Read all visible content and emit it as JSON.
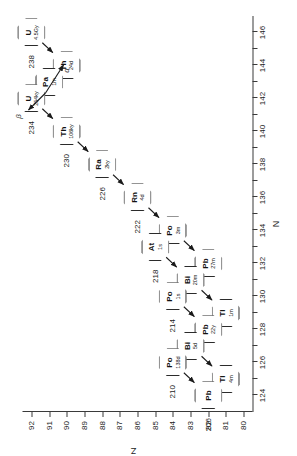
{
  "figure": {
    "type": "decay-chain-scatter",
    "orientation": "rotated-90",
    "x_axis": {
      "label": "N",
      "min": 123,
      "max": 147,
      "ticks": [
        124,
        125,
        126,
        127,
        128,
        129,
        130,
        131,
        132,
        133,
        134,
        135,
        136,
        137,
        138,
        139,
        140,
        141,
        142,
        143,
        144,
        145,
        146
      ],
      "labeled_ticks": [
        124,
        126,
        128,
        130,
        132,
        134,
        136,
        138,
        140,
        142,
        144,
        146
      ]
    },
    "y_axis": {
      "label": "Z",
      "min": 79.5,
      "max": 92.5,
      "ticks": [
        80,
        81,
        82,
        83,
        84,
        85,
        86,
        87,
        88,
        89,
        90,
        91,
        92
      ],
      "labeled_ticks": [
        80,
        81,
        82,
        83,
        84,
        85,
        86,
        87,
        88,
        89,
        90,
        91,
        92
      ]
    },
    "legend": {
      "beta_label": "β",
      "alpha_label": "α"
    }
  },
  "chart_data": {
    "type": "scatter",
    "title": "",
    "xlabel": "N",
    "ylabel": "Z",
    "xlim": [
      123,
      147
    ],
    "ylim": [
      79.5,
      92.5
    ],
    "grid": false,
    "legend_position": "top-right",
    "nodes": [
      {
        "id": "U238",
        "element": "U",
        "mass": 238,
        "Z": 92,
        "N": 146,
        "halflife": "4.5Gy",
        "mass_label": "238"
      },
      {
        "id": "Th234",
        "element": "Th",
        "mass": 234,
        "Z": 90,
        "N": 144,
        "halflife": "24d",
        "mass_label": ""
      },
      {
        "id": "Pa234",
        "element": "Pa",
        "mass": 234,
        "Z": 91,
        "N": 143,
        "halflife": "1m",
        "mass_label": ""
      },
      {
        "id": "U234",
        "element": "U",
        "mass": 234,
        "Z": 92,
        "N": 142,
        "halflife": "254ky",
        "mass_label": "234"
      },
      {
        "id": "Th230",
        "element": "Th",
        "mass": 230,
        "Z": 90,
        "N": 140,
        "halflife": "106ky",
        "mass_label": "230"
      },
      {
        "id": "Ra226",
        "element": "Ra",
        "mass": 226,
        "Z": 88,
        "N": 138,
        "halflife": "2ky",
        "mass_label": "226"
      },
      {
        "id": "Rn222",
        "element": "Rn",
        "mass": 222,
        "Z": 86,
        "N": 136,
        "halflife": "4d",
        "mass_label": "222"
      },
      {
        "id": "Po218",
        "element": "Po",
        "mass": 218,
        "Z": 84,
        "N": 134,
        "halflife": "3m",
        "mass_label": ""
      },
      {
        "id": "At218",
        "element": "At",
        "mass": 218,
        "Z": 85,
        "N": 133,
        "halflife": "1s",
        "mass_label": "218"
      },
      {
        "id": "Pb214",
        "element": "Pb",
        "mass": 214,
        "Z": 82,
        "N": 132,
        "halflife": "27m",
        "mass_label": ""
      },
      {
        "id": "Bi214",
        "element": "Bi",
        "mass": 214,
        "Z": 83,
        "N": 131,
        "halflife": "20m",
        "mass_label": ""
      },
      {
        "id": "Po214",
        "element": "Po",
        "mass": 214,
        "Z": 84,
        "N": 130,
        "halflife": "1s",
        "mass_label": "214"
      },
      {
        "id": "Tl210",
        "element": "Tl",
        "mass": 210,
        "Z": 81,
        "N": 129,
        "halflife": "1m",
        "mass_label": ""
      },
      {
        "id": "Pb210",
        "element": "Pb",
        "mass": 210,
        "Z": 82,
        "N": 128,
        "halflife": "22y",
        "mass_label": ""
      },
      {
        "id": "Bi210",
        "element": "Bi",
        "mass": 210,
        "Z": 83,
        "N": 127,
        "halflife": "5d",
        "mass_label": ""
      },
      {
        "id": "Po210",
        "element": "Po",
        "mass": 210,
        "Z": 84,
        "N": 126,
        "halflife": "138d",
        "mass_label": "210"
      },
      {
        "id": "Tl206",
        "element": "Tl",
        "mass": 206,
        "Z": 81,
        "N": 125,
        "halflife": "4m",
        "mass_label": ""
      },
      {
        "id": "Pb206",
        "element": "Pb",
        "mass": 206,
        "Z": 82,
        "N": 124,
        "halflife": "",
        "mass_label": "206"
      }
    ],
    "edges": [
      {
        "from": "U238",
        "to": "Th234",
        "decay": "alpha"
      },
      {
        "from": "Th234",
        "to": "Pa234",
        "decay": "beta"
      },
      {
        "from": "Pa234",
        "to": "U234",
        "decay": "beta"
      },
      {
        "from": "U234",
        "to": "Th230",
        "decay": "alpha"
      },
      {
        "from": "Th230",
        "to": "Ra226",
        "decay": "alpha"
      },
      {
        "from": "Ra226",
        "to": "Rn222",
        "decay": "alpha"
      },
      {
        "from": "Rn222",
        "to": "Po218",
        "decay": "alpha"
      },
      {
        "from": "Po218",
        "to": "At218",
        "decay": "beta"
      },
      {
        "from": "Po218",
        "to": "Pb214",
        "decay": "alpha"
      },
      {
        "from": "At218",
        "to": "Bi214",
        "decay": "alpha"
      },
      {
        "from": "Pb214",
        "to": "Bi214",
        "decay": "beta"
      },
      {
        "from": "Bi214",
        "to": "Po214",
        "decay": "beta"
      },
      {
        "from": "Bi214",
        "to": "Tl210",
        "decay": "alpha"
      },
      {
        "from": "Po214",
        "to": "Pb210",
        "decay": "alpha"
      },
      {
        "from": "Tl210",
        "to": "Pb210",
        "decay": "beta"
      },
      {
        "from": "Pb210",
        "to": "Bi210",
        "decay": "beta"
      },
      {
        "from": "Bi210",
        "to": "Po210",
        "decay": "beta"
      },
      {
        "from": "Bi210",
        "to": "Tl206",
        "decay": "alpha"
      },
      {
        "from": "Po210",
        "to": "Pb206",
        "decay": "alpha"
      },
      {
        "from": "Tl206",
        "to": "Pb206",
        "decay": "beta"
      }
    ]
  }
}
